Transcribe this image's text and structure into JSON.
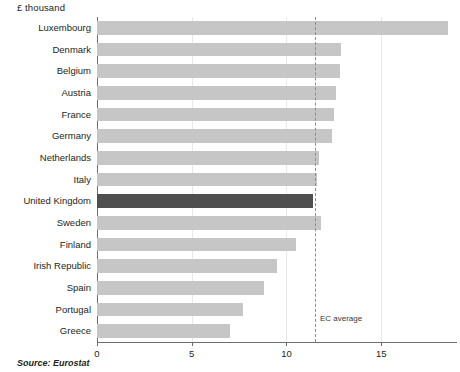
{
  "unit_label": "£ thousand",
  "source_note": "Source: Eurostat",
  "average_marker_label": "EC average",
  "colors": {
    "bar": "#c6c6c6",
    "bar_highlight": "#4f4f4f",
    "axis": "#6d6e70",
    "gridline": "#e8e8e8",
    "average_line": "#8c8c8c",
    "text": "#231f20",
    "background": "#ffffff"
  },
  "chart_data": {
    "type": "bar",
    "orientation": "horizontal",
    "title": "",
    "subtitle": "",
    "xlabel": "£ thousand",
    "ylabel": "",
    "xlim": [
      0,
      19
    ],
    "xticks": [
      0,
      5,
      10,
      15
    ],
    "xtick_labels": [
      "0",
      "5",
      "10",
      "15"
    ],
    "grid": true,
    "grid_axis": "x",
    "legend": false,
    "highlight_category": "United Kingdom",
    "annotations": [
      {
        "label": "EC average",
        "type": "vertical-dashed-line",
        "value": 11.5
      }
    ],
    "categories": [
      "Luxembourg",
      "Denmark",
      "Belgium",
      "Austria",
      "France",
      "Germany",
      "Netherlands",
      "Italy",
      "United Kingdom",
      "Sweden",
      "Finland",
      "Irish Republic",
      "Spain",
      "Portugal",
      "Greece"
    ],
    "values": [
      18.5,
      12.9,
      12.8,
      12.6,
      12.5,
      12.4,
      11.7,
      11.6,
      11.4,
      11.8,
      10.5,
      9.5,
      8.8,
      7.7,
      7.0
    ]
  }
}
